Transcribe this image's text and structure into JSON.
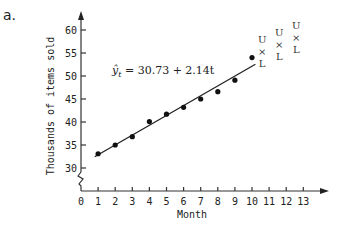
{
  "figure": {
    "panel_label": "a.",
    "equation": "ŷt = 30.73 + 2.14t",
    "equation_parts": {
      "yhat": "ŷ",
      "sub": "t",
      "rhs": " = 30.73 + 2.14t"
    }
  },
  "chart_data": {
    "type": "scatter",
    "title": "",
    "xlabel": "Month",
    "ylabel": "Thousands of items sold",
    "xlim": [
      0,
      13
    ],
    "ylim": [
      30,
      60
    ],
    "y_axis_break": true,
    "grid": false,
    "x_ticks": [
      "0",
      "1",
      "2",
      "3",
      "4",
      "5",
      "6",
      "7",
      "8",
      "9",
      "10",
      "11",
      "12",
      "13"
    ],
    "y_ticks": [
      "30",
      "35",
      "40",
      "45",
      "50",
      "55",
      "60"
    ],
    "series": [
      {
        "name": "Observed sales",
        "x": [
          1,
          2,
          3,
          4,
          5,
          6,
          7,
          8,
          9,
          10
        ],
        "values": [
          33.1,
          35.0,
          36.8,
          40.1,
          41.7,
          43.2,
          45.0,
          46.6,
          49.1,
          54.0
        ]
      }
    ],
    "trend_line": {
      "label": "ŷt = 30.73 + 2.14t",
      "intercept": 30.73,
      "slope": 2.14,
      "x_range": [
        0.8,
        10.2
      ]
    },
    "forecast_intervals": [
      {
        "x": 11,
        "upper": "U",
        "mid": "×",
        "lower": "L"
      },
      {
        "x": 12,
        "upper": "U",
        "mid": "×",
        "lower": "L"
      },
      {
        "x": 13,
        "upper": "U",
        "mid": "×",
        "lower": "L"
      }
    ]
  }
}
